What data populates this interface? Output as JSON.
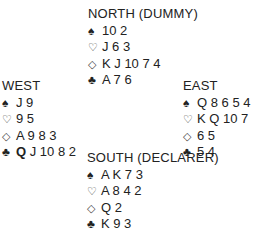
{
  "symbols": {
    "spades": "♠",
    "hearts": "♡",
    "diamonds": "◇",
    "clubs": "♣"
  },
  "hands": {
    "north": {
      "title": "NORTH (DUMMY)",
      "spades": "10 2",
      "hearts": "J 6 3",
      "diamonds": "K J 10 7 4",
      "clubs": "A 7 6"
    },
    "west": {
      "title": "WEST",
      "spades": "J 9",
      "hearts": "9 5",
      "diamonds": "A 9 8 3",
      "clubs_bold": "Q",
      "clubs": "J 10 8 2"
    },
    "east": {
      "title": "EAST",
      "spades": "Q 8 6 5 4",
      "hearts": "K Q 10 7",
      "diamonds": "6 5",
      "clubs": "5 4"
    },
    "south": {
      "title": "SOUTH (DECLARER)",
      "spades": "A K 7 3",
      "hearts": "A 8 4 2",
      "diamonds": "Q 2",
      "clubs": "K 9 3"
    }
  }
}
